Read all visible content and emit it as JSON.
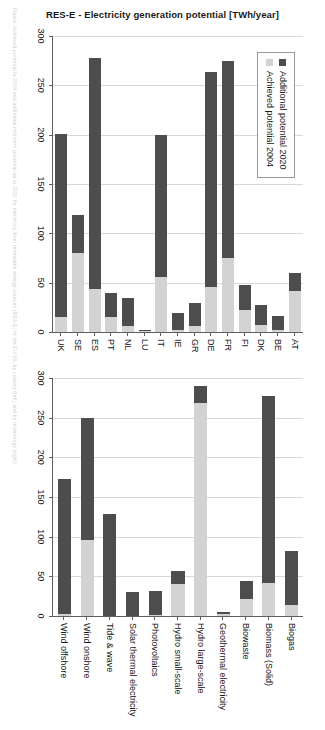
{
  "figure": {
    "axis_title": "RES-E - Electricity generation potential [TWh/year]",
    "legend": {
      "items": [
        {
          "label": "Additional potential 2020",
          "color": "#4d4d4d",
          "key": "additional"
        },
        {
          "label": "Achieved potential 2004",
          "color": "#d3d3d3",
          "key": "achieved"
        }
      ]
    },
    "caption_fragment": "Figure: Achieved potential in 2004 and additional mid-term potential up to 2020 for electricity from renewable energy sources (RES-E) in the EU-15, by country (left) and by technology (right)."
  },
  "chart_data": [
    {
      "id": "countries",
      "type": "bar",
      "orientation": "horizontal",
      "stacked": true,
      "title": "",
      "xlabel": "",
      "ylabel": "RES-E - Electricity generation potential [TWh/year]",
      "ylim": [
        0,
        300
      ],
      "ticks": [
        0,
        50,
        100,
        150,
        200,
        250,
        300
      ],
      "grid": true,
      "legend_position": "top-right",
      "categories": [
        "AT",
        "BE",
        "DK",
        "FI",
        "FR",
        "DE",
        "GR",
        "IE",
        "IT",
        "LU",
        "NL",
        "PT",
        "ES",
        "SE",
        "UK"
      ],
      "series": [
        {
          "name": "Achieved potential 2004",
          "color": "#d3d3d3",
          "values": [
            42,
            2,
            7,
            22,
            75,
            46,
            6,
            2,
            56,
            1,
            6,
            15,
            44,
            80,
            15
          ]
        },
        {
          "name": "Additional potential 2020",
          "color": "#4d4d4d",
          "values": [
            18,
            14,
            20,
            26,
            200,
            218,
            23,
            17,
            144,
            1,
            28,
            25,
            234,
            39,
            186
          ]
        }
      ]
    },
    {
      "id": "technologies",
      "type": "bar",
      "orientation": "horizontal",
      "stacked": true,
      "title": "",
      "xlabel": "",
      "ylabel": "",
      "ylim": [
        0,
        300
      ],
      "ticks": [
        0,
        50,
        100,
        150,
        200,
        250,
        300
      ],
      "grid": true,
      "categories": [
        "Biogas",
        "Biomass (Solid)",
        "Biowaste",
        "Geothermal electricity",
        "Hydro large-scale",
        "Hydro small-scale",
        "Photovoltaics",
        "Solar thermal electricity",
        "Tide & wave",
        "Wind onshore",
        "Wind offshore"
      ],
      "series": [
        {
          "name": "Achieved potential 2004",
          "color": "#d3d3d3",
          "values": [
            14,
            42,
            22,
            3,
            268,
            40,
            1,
            0,
            0,
            96,
            3
          ]
        },
        {
          "name": "Additional potential 2020",
          "color": "#4d4d4d",
          "values": [
            68,
            235,
            22,
            2,
            22,
            17,
            30,
            30,
            128,
            153,
            170
          ]
        }
      ]
    }
  ]
}
